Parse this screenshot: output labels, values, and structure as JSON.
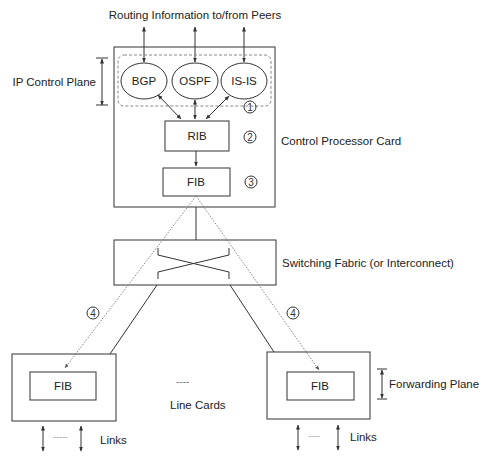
{
  "title_label": "Routing Information to/from Peers",
  "control_processor": {
    "label": "Control Processor Card",
    "control_plane_label": "IP Control Plane",
    "protocols": [
      "BGP",
      "OSPF",
      "IS-IS"
    ],
    "rib_label": "RIB",
    "fib_label": "FIB",
    "steps": {
      "one": "1",
      "two": "2",
      "three": "3"
    }
  },
  "switching_fabric": {
    "label": "Switching Fabric (or Interconnect)"
  },
  "line_cards": {
    "label": "Line Cards",
    "ellipsis": "----",
    "step_four": "4",
    "left": {
      "fib_label": "FIB",
      "links_label": "Links",
      "links_ellipsis": "-----"
    },
    "right": {
      "fib_label": "FIB",
      "links_label": "Links",
      "links_ellipsis": "----",
      "forwarding_plane_label": "Forwarding Plane"
    }
  }
}
